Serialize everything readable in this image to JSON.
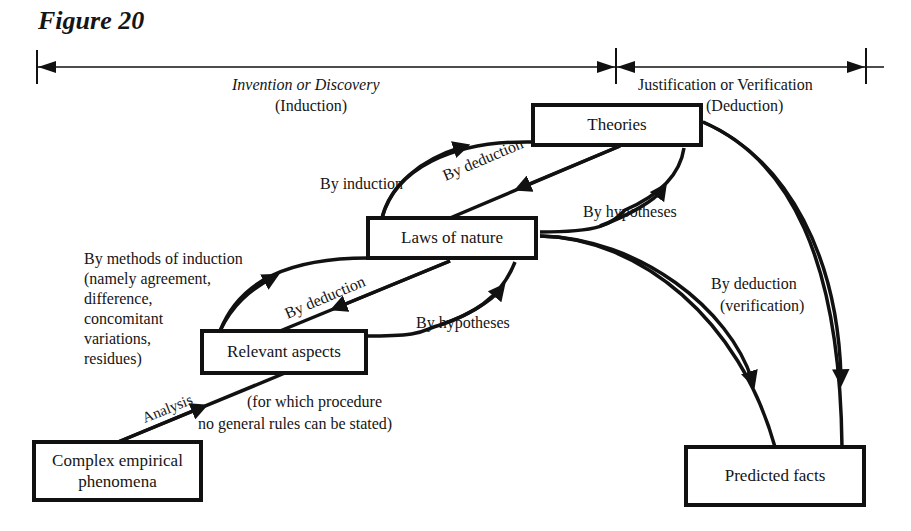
{
  "figure": {
    "title": "Figure 20"
  },
  "timeline": {
    "left_phase": {
      "title": "Invention or Discovery",
      "subtitle": "(Induction)"
    },
    "right_phase": {
      "title": "Justification or Verification",
      "subtitle": "(Deduction)"
    }
  },
  "nodes": {
    "theories": "Theories",
    "laws": "Laws of nature",
    "relevant": "Relevant aspects",
    "complex_line1": "Complex empirical",
    "complex_line2": "phenomena",
    "predicted": "Predicted facts"
  },
  "edges": {
    "laws_to_theories": "By induction",
    "theories_to_laws": "By deduction",
    "theories_hyp": "By hypotheses",
    "relevant_to_laws_lines": [
      "By methods of induction",
      "(namely agreement,",
      "difference,",
      "concomitant",
      "variations,",
      "residues)"
    ],
    "laws_to_relevant": "By deduction",
    "laws_hyp": "By hypotheses",
    "analysis": "Analysis",
    "analysis_note_line1": "(for which procedure",
    "analysis_note_line2": "no general rules can be stated)",
    "to_predicted_line1": "By deduction",
    "to_predicted_line2": "(verification)"
  },
  "colors": {
    "ink": "#111111",
    "paper": "#ffffff"
  }
}
